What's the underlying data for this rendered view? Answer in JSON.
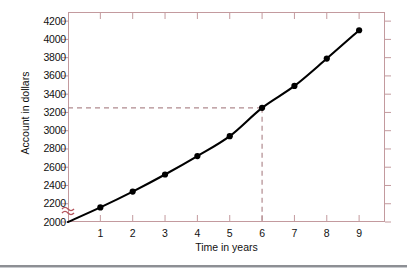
{
  "figure": {
    "axis_break_marker": "axis-break",
    "frame_color": "#c39a9e",
    "curve_color": "#000000",
    "guide_color": "#b08a8e",
    "marker_color": "#000000"
  },
  "chart_data": {
    "type": "line",
    "title": "",
    "xlabel": "Time in years",
    "ylabel": "Account in dollars",
    "x": [
      0,
      1,
      2,
      3,
      4,
      5,
      6,
      7,
      8,
      9
    ],
    "values": [
      2000,
      2160,
      2333,
      2520,
      2722,
      2940,
      3250,
      3490,
      3790,
      4100
    ],
    "xlim": [
      0,
      9.8
    ],
    "ylim": [
      2000,
      4300
    ],
    "xticks": [
      1,
      2,
      3,
      4,
      5,
      6,
      7,
      8,
      9
    ],
    "xtick_labels": [
      "1",
      "2",
      "3",
      "4",
      "5",
      "6",
      "7",
      "8",
      "9"
    ],
    "yticks": [
      2000,
      2200,
      2400,
      2600,
      2800,
      3000,
      3200,
      3400,
      3600,
      3800,
      4000,
      4200
    ],
    "ytick_labels": [
      "2000",
      "2200",
      "2400",
      "2600",
      "2800",
      "3000",
      "3200",
      "3400",
      "3600",
      "3800",
      "4000",
      "4200"
    ],
    "grid": false,
    "legend": null,
    "y_axis_break": true,
    "y_axis_break_note": "zigzag break below 2000",
    "markers": "filled-circle",
    "annotations": [
      {
        "type": "reference-lines",
        "x": 6,
        "y": 3250,
        "style": "dashed",
        "color": "#b08a8e",
        "description": "dashed horizontal line from y-axis to the curve at year 6, and dashed vertical line down to the x-axis"
      }
    ]
  }
}
